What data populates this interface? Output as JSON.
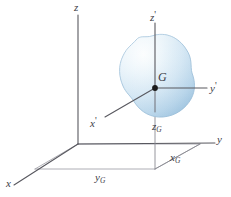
{
  "figure": {
    "background_color": "#ffffff",
    "axis_color": "#58585f",
    "guide_color": "#8a8a92",
    "label_color": "#3c3c46",
    "body_fill_light": "#f2f8fc",
    "body_fill_mid": "#cfe3f2",
    "body_fill_dark": "#a9c9e2",
    "body_stroke": "#9dbfd9",
    "point_color": "#1a1a1a"
  },
  "labels": {
    "z": "z",
    "x": "x",
    "y": "y",
    "z_prime_base": "z",
    "z_prime_mark": "'",
    "x_prime_base": "x",
    "x_prime_mark": "'",
    "y_prime_base": "y",
    "y_prime_mark": "'",
    "G": "G",
    "zG_base": "z",
    "zG_sub": "G",
    "yG_base": "y",
    "yG_sub": "G",
    "xG_base": "x",
    "xG_sub": "G"
  },
  "geometry": {
    "origin": {
      "x": 78,
      "y": 144
    },
    "z_axis_top": {
      "x": 78,
      "y": 14
    },
    "x_axis_end": {
      "x": 13,
      "y": 186
    },
    "y_axis_end": {
      "x": 216,
      "y": 143
    },
    "G_point": {
      "x": 155,
      "y": 88
    },
    "z_prime_top": {
      "x": 155,
      "y": 22
    },
    "y_prime_end": {
      "x": 208,
      "y": 88
    },
    "x_prime_end": {
      "x": 104,
      "y": 118
    },
    "ground_corner": {
      "x": 155,
      "y": 168
    }
  }
}
